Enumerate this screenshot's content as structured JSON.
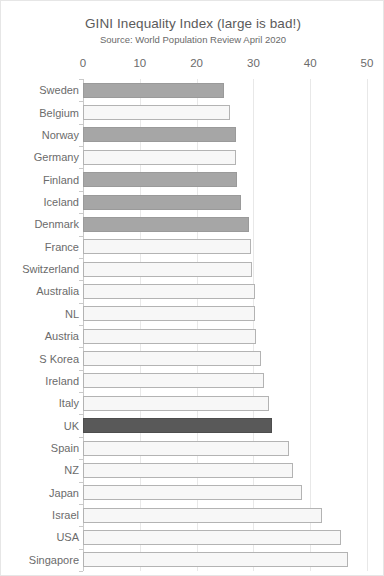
{
  "chart_data": {
    "type": "bar",
    "orientation": "horizontal",
    "title": "GINI Inequality Index (large is bad!)",
    "subtitle": "Source: World Population Review April 2020",
    "xlabel": "",
    "ylabel": "",
    "xlim": [
      0,
      50
    ],
    "xticks": [
      0,
      10,
      20,
      30,
      40,
      50
    ],
    "xtick_labels": [
      "0",
      "10",
      "20",
      "30",
      "40",
      "50"
    ],
    "grid": true,
    "grid_axis": "x",
    "legend": "none",
    "axis_position": "top",
    "categories": [
      "Sweden",
      "Belgium",
      "Norway",
      "Germany",
      "Finland",
      "Iceland",
      "Denmark",
      "France",
      "Switzerland",
      "Australia",
      "NL",
      "Austria",
      "S Korea",
      "Ireland",
      "Italy",
      "UK",
      "Spain",
      "NZ",
      "Japan",
      "Israel",
      "USA",
      "Singapore"
    ],
    "values": [
      24.9,
      25.9,
      27.0,
      27.0,
      27.1,
      27.8,
      29.3,
      29.6,
      29.7,
      30.3,
      30.3,
      30.5,
      31.4,
      31.8,
      32.7,
      33.2,
      36.2,
      36.9,
      38.5,
      42.0,
      45.4,
      46.6
    ],
    "bar_styles": [
      "mid",
      "light",
      "mid",
      "light",
      "mid",
      "mid",
      "mid",
      "light",
      "light",
      "light",
      "light",
      "light",
      "light",
      "light",
      "light",
      "dark",
      "light",
      "light",
      "light",
      "light",
      "light",
      "light"
    ],
    "colors": {
      "mid": "#a6a6a6",
      "light": "#f7f7f7",
      "dark": "#595959",
      "border": "#b3b3b3",
      "grid": "#e8e8e8",
      "text": "#6b6b6b"
    }
  }
}
